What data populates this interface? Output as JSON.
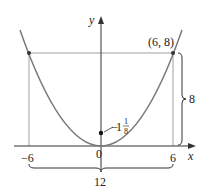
{
  "diagram": {
    "type": "parabola",
    "equation_implied": "x^2 = 4.5y (y = x^2/4.5)",
    "axes": {
      "x_label": "x",
      "y_label": "y"
    },
    "tick_labels": {
      "neg6": "−6",
      "zero": "0",
      "pos6": "6"
    },
    "point_label": "(6, 8)",
    "focus_label_whole": "1",
    "focus_label_num": "1",
    "focus_label_den": "8",
    "height_label": "8",
    "width_label": "12",
    "colors": {
      "curve": "#7a7a7a",
      "axes": "#333333",
      "lines": "#777777",
      "text": "#222222"
    }
  }
}
